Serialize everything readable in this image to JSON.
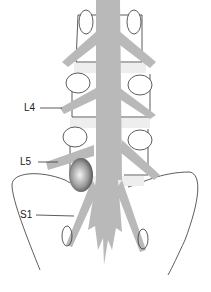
{
  "figure": {
    "labels": [
      {
        "id": "L4",
        "text": "L4",
        "x": 24,
        "y": 103
      },
      {
        "id": "L5",
        "text": "L5",
        "x": 20,
        "y": 157
      },
      {
        "id": "S1",
        "text": "S1",
        "x": 20,
        "y": 210
      }
    ],
    "colors": {
      "nerve": "#b9b9b9",
      "outline": "#333333",
      "disc_fill": "#eeeeee",
      "herniation_dark": "#555555",
      "herniation_light": "#f4f4f4"
    }
  }
}
